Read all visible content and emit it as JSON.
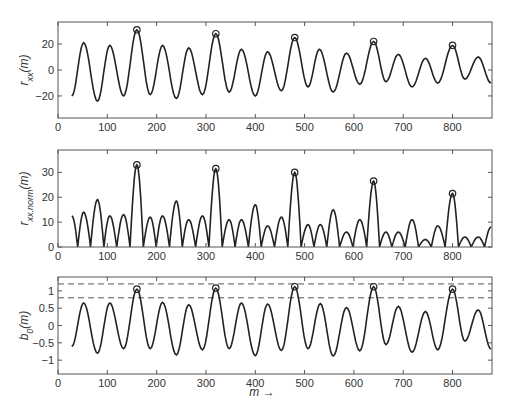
{
  "chart_data": [
    {
      "type": "line",
      "title": "",
      "xlabel": "",
      "ylabel": "r_xx(m)",
      "ylabel_main": "r",
      "ylabel_sub": "xx",
      "ylabel_tail": "(m)",
      "xlim": [
        0,
        880
      ],
      "ylim": [
        -37,
        37
      ],
      "xticks": [
        0,
        100,
        200,
        300,
        400,
        500,
        600,
        700,
        800
      ],
      "yticks": [
        -20,
        0,
        20
      ],
      "grid": false,
      "box": {
        "x": 58,
        "y": 22,
        "w": 434,
        "h": 96
      },
      "series": [
        {
          "name": "r_xx",
          "x": [
            28,
            52,
            80,
            105,
            133,
            160,
            187,
            212,
            240,
            265,
            293,
            320,
            347,
            372,
            400,
            425,
            453,
            480,
            507,
            530,
            558,
            585,
            612,
            640,
            665,
            690,
            718,
            745,
            770,
            800,
            825,
            852,
            878
          ],
          "values": [
            -20,
            21,
            -24,
            19,
            -20,
            31,
            -19,
            19,
            -22,
            17,
            -19,
            28,
            -17,
            16,
            -20,
            14,
            -16,
            25,
            -13,
            16,
            -17,
            13,
            -11,
            22,
            -9,
            12,
            -13,
            9,
            -10,
            19,
            -7,
            10,
            -10
          ]
        }
      ],
      "markers": {
        "x": [
          160,
          320,
          480,
          640,
          800
        ],
        "values": [
          31,
          28,
          25,
          22,
          19
        ],
        "symbol": "circle"
      }
    },
    {
      "type": "line",
      "title": "",
      "xlabel": "",
      "ylabel": "r_xx,norm(m)",
      "ylabel_main": "r",
      "ylabel_sub": "xx,norm",
      "ylabel_tail": "(m)",
      "xlim": [
        0,
        880
      ],
      "ylim": [
        0,
        39
      ],
      "xticks": [
        0,
        100,
        200,
        300,
        400,
        500,
        600,
        700,
        800
      ],
      "yticks": [
        0,
        10,
        20,
        30
      ],
      "grid": false,
      "box": {
        "x": 58,
        "y": 150,
        "w": 434,
        "h": 97
      },
      "series": [
        {
          "name": "r_xx,norm",
          "x": [
            28,
            40,
            52,
            66,
            80,
            93,
            105,
            119,
            133,
            146,
            160,
            173,
            187,
            199,
            212,
            226,
            240,
            252,
            265,
            279,
            293,
            306,
            320,
            333,
            347,
            359,
            372,
            386,
            400,
            412,
            425,
            439,
            453,
            466,
            480,
            493,
            507,
            519,
            532,
            545,
            558,
            571,
            585,
            598,
            612,
            626,
            640,
            652,
            665,
            677,
            690,
            704,
            718,
            731,
            745,
            757,
            770,
            785,
            800,
            812,
            825,
            838,
            852,
            865,
            878
          ],
          "values": [
            12.5,
            0,
            14,
            0,
            19,
            0,
            12.5,
            0,
            13,
            0,
            33,
            0,
            12,
            0,
            12.5,
            0,
            18.5,
            0,
            11,
            0,
            12.5,
            0,
            31.5,
            0,
            11,
            0,
            11,
            0,
            17,
            0,
            8.5,
            0,
            12,
            0,
            30,
            0,
            9,
            0,
            9,
            0,
            15,
            0,
            6,
            0,
            11,
            0,
            26.5,
            0,
            6,
            0,
            6,
            0,
            11,
            0,
            3,
            0,
            8.5,
            0,
            21.5,
            0,
            4,
            0,
            4,
            0,
            8
          ]
        }
      ],
      "markers": {
        "x": [
          160,
          320,
          480,
          640,
          800
        ],
        "values": [
          33,
          31.5,
          30,
          26.5,
          21.5
        ],
        "symbol": "circle"
      }
    },
    {
      "type": "line",
      "title": "",
      "xlabel": "m →",
      "ylabel": "b_0(m)",
      "ylabel_main": "b",
      "ylabel_sub": "0",
      "ylabel_tail": "(m)",
      "xlim": [
        0,
        880
      ],
      "ylim": [
        -1.4,
        1.4
      ],
      "xticks": [
        0,
        100,
        200,
        300,
        400,
        500,
        600,
        700,
        800
      ],
      "yticks": [
        -1,
        -0.5,
        0,
        0.5,
        1
      ],
      "ytick_labels": [
        "−1",
        "−0.5",
        "0",
        "0.5",
        "1"
      ],
      "grid": false,
      "box": {
        "x": 58,
        "y": 277,
        "w": 434,
        "h": 97
      },
      "thresholds": [
        1.2,
        0.8
      ],
      "series": [
        {
          "name": "b_0",
          "x": [
            28,
            52,
            80,
            105,
            133,
            160,
            187,
            212,
            240,
            265,
            293,
            320,
            347,
            372,
            400,
            425,
            453,
            480,
            507,
            532,
            558,
            585,
            612,
            640,
            665,
            690,
            718,
            745,
            770,
            800,
            825,
            852,
            878
          ],
          "values": [
            -0.6,
            0.65,
            -0.8,
            0.65,
            -0.67,
            1.05,
            -0.67,
            0.67,
            -0.85,
            0.6,
            -0.7,
            1.08,
            -0.67,
            0.65,
            -0.87,
            0.62,
            -0.72,
            1.12,
            -0.67,
            0.63,
            -0.88,
            0.52,
            -0.73,
            1.12,
            -0.55,
            0.55,
            -0.77,
            0.4,
            -0.7,
            1.05,
            -0.45,
            0.45,
            -0.68
          ]
        }
      ],
      "markers": {
        "x": [
          160,
          320,
          480,
          640,
          800
        ],
        "values": [
          1.05,
          1.08,
          1.12,
          1.12,
          1.05
        ],
        "symbol": "circle"
      }
    }
  ],
  "labels": {
    "xlabel": "m →"
  }
}
